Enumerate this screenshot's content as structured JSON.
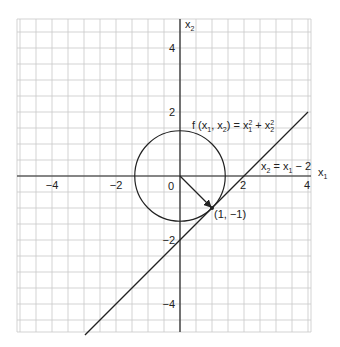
{
  "figure": {
    "axes": {
      "x_label": "x",
      "x_label_sub": "1",
      "y_label": "x",
      "y_label_sub": "2",
      "x_range": [
        -5,
        4
      ],
      "y_range": [
        -5,
        5
      ],
      "x_ticks": [
        {
          "value": -4,
          "label": "−4"
        },
        {
          "value": -2,
          "label": "−2"
        },
        {
          "value": 0,
          "label": "0"
        },
        {
          "value": 2,
          "label": "2"
        },
        {
          "value": 4,
          "label": "4"
        }
      ],
      "y_ticks": [
        {
          "value": 4,
          "label": "4"
        },
        {
          "value": 2,
          "label": "2"
        },
        {
          "value": -2,
          "label": "−2"
        },
        {
          "value": -4,
          "label": "−4"
        }
      ],
      "grid_step": 0.5
    },
    "circle": {
      "center": [
        0,
        0
      ],
      "radius": 1.414,
      "label": "f (x₁, x₂) = x₁² + x₂²"
    },
    "constraint_line": {
      "equation": "x2 = x1 − 2",
      "label": "x₂ = x₁ − 2",
      "from": [
        -2.97,
        -4.97
      ],
      "to": [
        4,
        2
      ]
    },
    "tangent_point": {
      "coords": [
        1,
        -1
      ],
      "label": "(1, −1)"
    },
    "gradient_arrow": {
      "from": [
        0,
        0
      ],
      "to": [
        1,
        -1
      ]
    },
    "colors": {
      "grid": "#c8c8c8",
      "ink": "#222222"
    }
  }
}
